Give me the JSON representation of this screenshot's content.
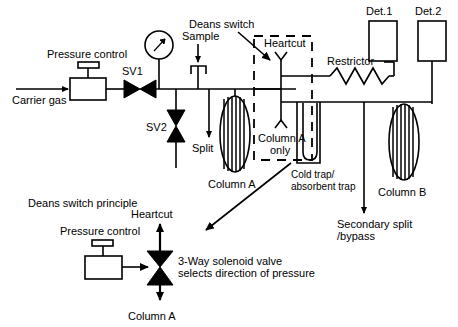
{
  "figure": {
    "background_color": "#ffffff",
    "line_color": "#000000",
    "width": 458,
    "height": 327
  },
  "top_schematic": {
    "labels": {
      "carrier_gas": "Carrier gas",
      "pressure_control": "Pressure control",
      "sv1": "SV1",
      "sv2": "SV2",
      "sample": "Sample",
      "split": "Split",
      "deans_switch": "Deans switch",
      "heartcut": "Heartcut",
      "column_a_only_line1": "Column A",
      "column_a_only_line2": "only",
      "column_a": "Column A",
      "column_b": "Column B",
      "restrictor": "Restrictor",
      "cold_trap_line1": "Cold trap/",
      "cold_trap_line2": "absorbent trap",
      "secondary_split_line1": "Secondary split",
      "secondary_split_line2": "/bypass",
      "det1": "Det.1",
      "det2": "Det.2"
    }
  },
  "bottom_schematic": {
    "labels": {
      "principle_title": "Deans switch principle",
      "pressure_control": "Pressure control",
      "heartcut": "Heartcut",
      "column_a": "Column A",
      "valve_desc_line1": "3-Way solenoid valve",
      "valve_desc_line2": "selects direction of pressure"
    }
  },
  "icons": {
    "gauge": "pressure-gauge-icon",
    "valve_bowtie": "bowtie-valve-icon",
    "coil": "column-coil-icon",
    "zigzag": "restrictor-zigzag-icon",
    "u_tube": "cold-trap-utube-icon",
    "arrow": "flow-arrow-icon"
  }
}
